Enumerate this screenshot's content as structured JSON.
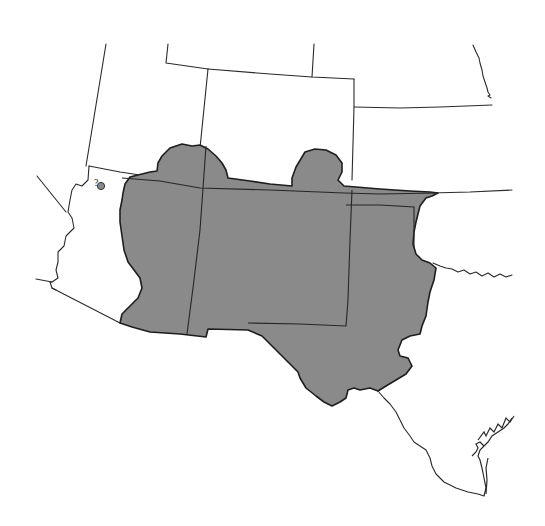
{
  "map": {
    "type": "species range map",
    "region": "Southwestern United States",
    "colors": {
      "background": "#ffffff",
      "range_fill": "#8a8a8a",
      "border_stroke": "#2a2a2a"
    },
    "legend": {
      "range_label": "Known range (shaded)",
      "uncertain_marker": "?"
    },
    "uncertain_record": {
      "symbol": "?",
      "marker": "gray dot",
      "location": "northwestern Arizona"
    },
    "caption": {
      "text": "",
      "note": "Caption line is cropped at bottom edge; text not legible"
    }
  }
}
